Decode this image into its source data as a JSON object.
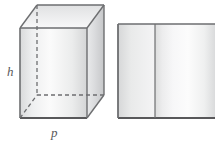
{
  "figure": {
    "background_color": "#ffffff",
    "labels": {
      "height": "h",
      "base": "p"
    },
    "label_color": "#58585a",
    "shapes": [
      {
        "name": "rectangular-prism",
        "type": "3d-box",
        "stroke_color": "#6d6e70",
        "hidden_edge_style": "dashed",
        "faces": {
          "front": {
            "fill_light": "#fdfdfd",
            "fill_dark": "#d8d9da"
          },
          "right": {
            "fill_light": "#e8e9ea",
            "fill_dark": "#c9cacb"
          },
          "top": {
            "fill_light": "#f6f6f7",
            "fill_dark": "#e2e3e4"
          }
        },
        "vertices": {
          "front_top_left": [
            20,
            28
          ],
          "front_top_right": [
            87,
            28
          ],
          "front_bottom_left": [
            20,
            118
          ],
          "front_bottom_right": [
            87,
            118
          ],
          "back_top_left": [
            37,
            5
          ],
          "back_top_right": [
            104,
            5
          ],
          "back_bottom_left": [
            37,
            95
          ],
          "back_bottom_right": [
            104,
            95
          ]
        }
      },
      {
        "name": "rectangular-panel",
        "type": "2d-rectangle",
        "stroke_color": "#6d6e70",
        "fill_light": "#fdfdfd",
        "fill_dark": "#d5d6d7",
        "divider": {
          "name": "panel-divider",
          "x": 155
        },
        "bounds": {
          "x": 118,
          "y": 24,
          "width": 97,
          "height": 94
        }
      }
    ]
  }
}
